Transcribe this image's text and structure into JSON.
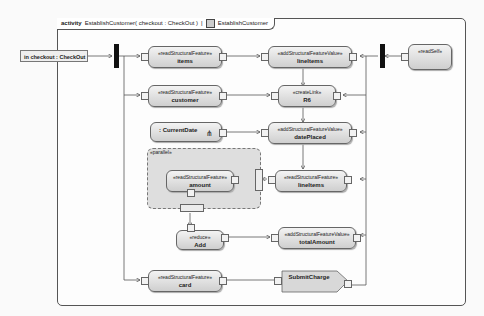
{
  "frame": {
    "keyword": "activity",
    "signature": "EstablishCustomer( checkout : CheckOut )",
    "diagram_ref": "EstablishCustomer"
  },
  "parameter": {
    "label": "in checkout : CheckOut"
  },
  "nodes": {
    "items": {
      "stereotype": "«readStructuralFeature»",
      "name": "items"
    },
    "lineitems_add": {
      "stereotype": "«addStructuralFeatureValue»",
      "name": "lineItems"
    },
    "readself": {
      "stereotype": "«readSelf»",
      "name": ""
    },
    "customer": {
      "stereotype": "«readStructuralFeature»",
      "name": "customer"
    },
    "createlink": {
      "stereotype": "«createLink»",
      "name": "R6"
    },
    "currentdate": {
      "stereotype": "",
      "name": ": CurrentDate"
    },
    "dateplaced": {
      "stereotype": "«addStructuralFeatureValue»",
      "name": "datePlaced"
    },
    "lineitems_read": {
      "stereotype": "«readStructuralFeature»",
      "name": "lineItems"
    },
    "amount": {
      "stereotype": "«readStructuralFeature»",
      "name": "amount"
    },
    "add": {
      "stereotype": "«reduce»",
      "name": "Add"
    },
    "totalamount": {
      "stereotype": "«addStructuralFeatureValue»",
      "name": "totalAmount"
    },
    "card": {
      "stereotype": "«readStructuralFeature»",
      "name": "card"
    },
    "submitcharge": {
      "stereotype": "",
      "name": "SubmitCharge"
    }
  },
  "region": {
    "label": "«parallel»"
  }
}
